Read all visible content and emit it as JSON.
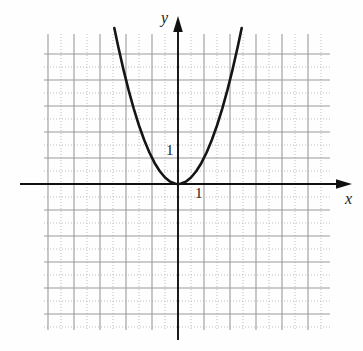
{
  "figure": {
    "title": "",
    "background_color": "#fefefe"
  },
  "axes": {
    "x_label": "x",
    "y_label": "y",
    "x_axis_color": "#111111",
    "y_axis_color": "#111111",
    "origin_px": {
      "x": 178,
      "y": 184
    },
    "unit_px": 26
  },
  "tick_labels": {
    "y_unit": "1",
    "x_unit": "1"
  },
  "grid": {
    "major_color": "#9a9a9a",
    "minor_color": "#bdbdbd",
    "major_spacing_px": 26,
    "minor_spacing_px": 13,
    "left_px": 44,
    "right_px": 330,
    "top_px": 34,
    "bottom_px": 330,
    "minor_style": "dotted",
    "major_style": "solid"
  },
  "chart_data": {
    "type": "line",
    "title": "",
    "xlabel": "x",
    "ylabel": "y",
    "grid": true,
    "legend": "none",
    "xlim": [
      -5.2,
      5.8
    ],
    "ylim": [
      -5.6,
      5.8
    ],
    "xticks": [
      -5,
      -4,
      -3,
      -2,
      -1,
      0,
      1,
      2,
      3,
      4,
      5
    ],
    "yticks": [
      -5,
      -4,
      -3,
      -2,
      -1,
      0,
      1,
      2,
      3,
      4,
      5
    ],
    "annotations": [
      {
        "text": "1",
        "x": -0.45,
        "y": 1.25
      },
      {
        "text": "1",
        "x": 0.72,
        "y": -0.55
      }
    ],
    "series": [
      {
        "name": "y = x^2",
        "equation": "y = x^2",
        "curve_color": "#151515",
        "curve_width_px": 2.6,
        "vertex": [
          0,
          0
        ],
        "opens": "up",
        "x": [
          -2.45,
          -2.3,
          -2.1,
          -1.9,
          -1.7,
          -1.5,
          -1.3,
          -1.1,
          -0.9,
          -0.7,
          -0.5,
          -0.3,
          -0.1,
          0,
          0.1,
          0.3,
          0.5,
          0.7,
          0.9,
          1.1,
          1.3,
          1.5,
          1.7,
          1.9,
          2.1,
          2.3,
          2.45
        ],
        "values": [
          6.0,
          5.29,
          4.41,
          3.61,
          2.89,
          2.25,
          1.69,
          1.21,
          0.81,
          0.49,
          0.25,
          0.09,
          0.01,
          0,
          0.01,
          0.09,
          0.25,
          0.49,
          0.81,
          1.21,
          1.69,
          2.25,
          2.89,
          3.61,
          4.41,
          5.29,
          6.0
        ]
      }
    ]
  }
}
